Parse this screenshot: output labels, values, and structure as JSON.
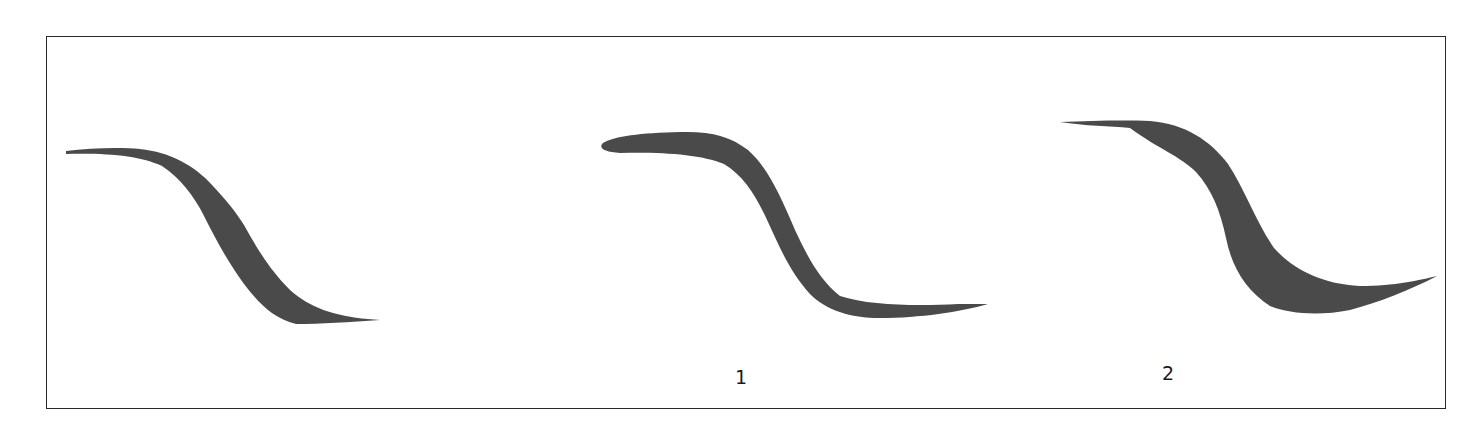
{
  "figure": {
    "title": "",
    "ink_color": "#4a4a4a",
    "border_color": "#2a2a2a",
    "panels": [
      {
        "id": "stroke-0",
        "label": "",
        "description": "S-curve brush stroke, tapered start and end"
      },
      {
        "id": "stroke-1",
        "label": "1",
        "description": "S-curve brush stroke with blunt rounded start and dry-brush tail"
      },
      {
        "id": "stroke-2",
        "label": "2",
        "description": "S-curve brush stroke with thin start and thick belly, sharp upturned tail"
      }
    ]
  }
}
